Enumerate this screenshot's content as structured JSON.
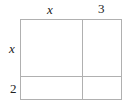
{
  "diagram": {
    "type": "area-model",
    "top_labels": [
      "x",
      "3"
    ],
    "side_labels": [
      "x",
      "2"
    ],
    "line_color": "#b0b0b0"
  }
}
